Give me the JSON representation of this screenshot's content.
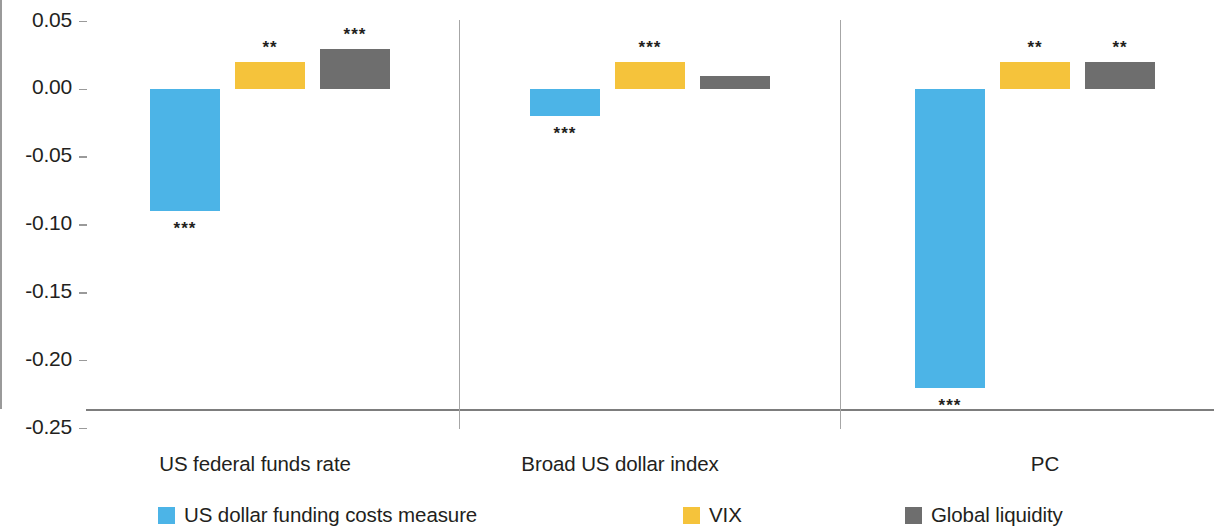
{
  "chart_data": {
    "type": "bar",
    "title": "",
    "subtitle": "",
    "xlabel": "",
    "ylabel": "",
    "ylim": [
      -0.25,
      0.05
    ],
    "yticks": [
      "0.05",
      "0.00",
      "-0.05",
      "-0.10",
      "-0.15",
      "-0.20",
      "-0.25"
    ],
    "ytick_values": [
      0.05,
      0.0,
      -0.05,
      -0.1,
      -0.15,
      -0.2,
      -0.25
    ],
    "grid": false,
    "legend_position": "bottom",
    "categories": [
      "US federal funds rate",
      "Broad US dollar index",
      "PC"
    ],
    "series": [
      {
        "name": "US dollar funding costs measure",
        "color": "#4cb4e7",
        "values": [
          -0.09,
          -0.02,
          -0.22
        ],
        "significance": [
          "***",
          "***",
          "***"
        ]
      },
      {
        "name": "VIX",
        "color": "#f5c33b",
        "values": [
          0.02,
          0.02,
          0.02
        ],
        "significance": [
          "**",
          "***",
          "**"
        ]
      },
      {
        "name": "Global liquidity",
        "color": "#6e6e6e",
        "values": [
          0.03,
          0.01,
          0.02
        ],
        "significance": [
          "***",
          "",
          "**"
        ]
      }
    ]
  },
  "axis": {
    "tick_labels": [
      "0.05",
      "0.00",
      "-0.05",
      "-0.10",
      "-0.15",
      "-0.20",
      "-0.25"
    ]
  },
  "categories": [
    {
      "label": "US federal funds rate"
    },
    {
      "label": "Broad US dollar index"
    },
    {
      "label": "PC"
    }
  ],
  "legend": [
    {
      "label": "US dollar funding costs measure",
      "color": "#4cb4e7"
    },
    {
      "label": "VIX",
      "color": "#f5c33b"
    },
    {
      "label": "Global liquidity",
      "color": "#6e6e6e"
    }
  ]
}
